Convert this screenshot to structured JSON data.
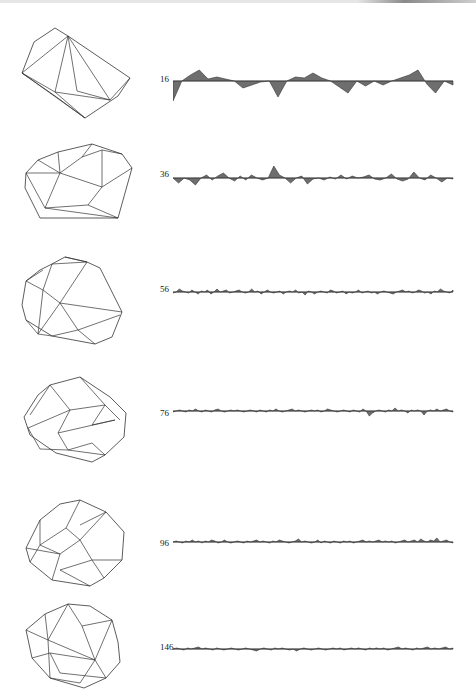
{
  "figure": {
    "fill_color": "#6e6e6e",
    "stroke_color": "#333333",
    "rows": [
      {
        "label": "16",
        "top": 8,
        "poly_points": [
          [
            22,
            65
          ],
          [
            34,
            34
          ],
          [
            55,
            20
          ],
          [
            68,
            28
          ],
          [
            130,
            70
          ],
          [
            118,
            88
          ],
          [
            85,
            110
          ],
          [
            55,
            88
          ]
        ],
        "poly_edges": [
          [
            68,
            28,
            55,
            84
          ],
          [
            68,
            28,
            77,
            83
          ],
          [
            68,
            28,
            110,
            92
          ],
          [
            68,
            28,
            22,
            65
          ],
          [
            55,
            84,
            110,
            92
          ],
          [
            77,
            83,
            110,
            92
          ],
          [
            22,
            65,
            55,
            84
          ],
          [
            55,
            84,
            85,
            110
          ],
          [
            110,
            92,
            130,
            70
          ],
          [
            22,
            65,
            85,
            110
          ]
        ],
        "sig_top": 60,
        "sig_height": 45,
        "label_y": 74,
        "baseline": 21,
        "values": [
          -20,
          0,
          6,
          11,
          2,
          4,
          2,
          0,
          -7,
          -4,
          -1,
          0,
          -16,
          0,
          4,
          3,
          8,
          3,
          0,
          -6,
          -12,
          0,
          -5,
          0,
          -4,
          0,
          3,
          6,
          11,
          -3,
          -12,
          0,
          -4
        ]
      },
      {
        "label": "36",
        "top": 130,
        "poly_points": [
          [
            26,
            43
          ],
          [
            38,
            30
          ],
          [
            58,
            22
          ],
          [
            92,
            14
          ],
          [
            122,
            24
          ],
          [
            132,
            38
          ],
          [
            118,
            88
          ],
          [
            40,
            88
          ],
          [
            25,
            58
          ]
        ],
        "poly_edges": [
          [
            58,
            22,
            60,
            43
          ],
          [
            60,
            43,
            102,
            57
          ],
          [
            60,
            43,
            26,
            43
          ],
          [
            60,
            43,
            45,
            78
          ],
          [
            92,
            14,
            82,
            27
          ],
          [
            82,
            27,
            60,
            43
          ],
          [
            102,
            57,
            102,
            20
          ],
          [
            102,
            57,
            132,
            38
          ],
          [
            102,
            57,
            88,
            75
          ],
          [
            88,
            75,
            45,
            78
          ],
          [
            88,
            75,
            118,
            88
          ],
          [
            45,
            78,
            118,
            88
          ],
          [
            26,
            43,
            45,
            78
          ],
          [
            38,
            30,
            60,
            43
          ],
          [
            102,
            20,
            82,
            27
          ],
          [
            122,
            24,
            102,
            20
          ]
        ],
        "sig_top": 150,
        "sig_height": 45,
        "label_y": 169,
        "baseline": 28,
        "values": [
          0,
          -5,
          0,
          -2,
          -7,
          0,
          3,
          -2,
          2,
          5,
          0,
          -3,
          2,
          -2,
          3,
          0,
          -2,
          0,
          12,
          3,
          0,
          -5,
          0,
          2,
          -6,
          -1,
          0,
          -2,
          1,
          -1,
          3,
          -1,
          2,
          0,
          1,
          3,
          -1,
          -2,
          0,
          4,
          -1,
          -3,
          -1,
          6,
          0,
          -2,
          3,
          0,
          -4,
          0,
          -1
        ]
      },
      {
        "label": "56",
        "top": 240,
        "poly_points": [
          [
            26,
            41
          ],
          [
            40,
            30
          ],
          [
            52,
            24
          ],
          [
            65,
            17
          ],
          [
            87,
            22
          ],
          [
            100,
            28
          ],
          [
            122,
            72
          ],
          [
            112,
            97
          ],
          [
            95,
            104
          ],
          [
            52,
            96
          ],
          [
            26,
            80
          ],
          [
            22,
            65
          ]
        ],
        "poly_edges": [
          [
            52,
            24,
            43,
            50
          ],
          [
            43,
            50,
            60,
            63
          ],
          [
            60,
            63,
            87,
            22
          ],
          [
            60,
            63,
            122,
            72
          ],
          [
            60,
            63,
            38,
            94
          ],
          [
            60,
            63,
            78,
            90
          ],
          [
            43,
            50,
            26,
            41
          ],
          [
            43,
            50,
            38,
            94
          ],
          [
            26,
            41,
            43,
            30
          ],
          [
            78,
            90,
            120,
            75
          ],
          [
            78,
            90,
            95,
            104
          ],
          [
            78,
            90,
            52,
            96
          ],
          [
            38,
            94,
            52,
            96
          ],
          [
            26,
            80,
            38,
            94
          ],
          [
            52,
            24,
            87,
            22
          ],
          [
            65,
            17,
            87,
            22
          ]
        ],
        "sig_top": 275,
        "sig_height": 35,
        "label_y": 284,
        "baseline": 17,
        "values": [
          -1,
          0,
          3,
          1,
          0,
          -1,
          2,
          0,
          -2,
          1,
          0,
          2,
          -2,
          0,
          3,
          0,
          1,
          2,
          -1,
          0,
          1,
          2,
          0,
          -1,
          0,
          3,
          0,
          1,
          -2,
          0,
          2,
          0,
          -1,
          0,
          1,
          -2,
          0,
          1,
          0,
          2,
          -1,
          0,
          -3,
          1,
          0,
          -2,
          0,
          1,
          0,
          -1,
          2,
          1,
          -1,
          0,
          1,
          -2,
          0,
          -1,
          0,
          2,
          -1,
          0,
          1,
          -1,
          0,
          -2,
          0,
          1,
          0,
          -1,
          -2,
          0,
          1,
          2,
          0,
          1,
          -1,
          0,
          2,
          1,
          -1,
          0,
          -2,
          1,
          0,
          3,
          1,
          0,
          -1,
          2
        ]
      },
      {
        "label": "76",
        "top": 365,
        "poly_points": [
          [
            24,
            52
          ],
          [
            38,
            30
          ],
          [
            50,
            20
          ],
          [
            80,
            12
          ],
          [
            110,
            32
          ],
          [
            126,
            48
          ],
          [
            124,
            72
          ],
          [
            105,
            90
          ],
          [
            92,
            97
          ],
          [
            56,
            88
          ],
          [
            30,
            70
          ]
        ],
        "poly_edges": [
          [
            50,
            20,
            70,
            45
          ],
          [
            70,
            45,
            105,
            40
          ],
          [
            70,
            45,
            28,
            63
          ],
          [
            70,
            45,
            58,
            68
          ],
          [
            58,
            68,
            68,
            85
          ],
          [
            68,
            85,
            105,
            90
          ],
          [
            58,
            68,
            115,
            55
          ],
          [
            105,
            40,
            120,
            55
          ],
          [
            28,
            63,
            40,
            84
          ],
          [
            40,
            84,
            68,
            85
          ],
          [
            80,
            12,
            105,
            40
          ],
          [
            50,
            20,
            30,
            50
          ],
          [
            92,
            78,
            105,
            90
          ],
          [
            92,
            78,
            68,
            85
          ],
          [
            105,
            40,
            92,
            60
          ],
          [
            92,
            60,
            115,
            55
          ]
        ],
        "sig_top": 397,
        "sig_height": 30,
        "label_y": 408,
        "baseline": 14,
        "values": [
          -1,
          0,
          1,
          0,
          -1,
          1,
          0,
          2,
          0,
          -1,
          1,
          0,
          -1,
          1,
          2,
          0,
          -1,
          0,
          1,
          0,
          1,
          0,
          -1,
          0,
          1,
          0,
          -1,
          1,
          0,
          -1,
          1,
          0,
          2,
          0,
          -1,
          0,
          1,
          2,
          0,
          1,
          0,
          -1,
          0,
          1,
          0,
          1,
          -1,
          0,
          2,
          1,
          0,
          -1,
          0,
          1,
          0,
          -1,
          1,
          0,
          -1,
          2,
          0,
          -5,
          -2,
          0,
          1,
          0,
          -1,
          1,
          0,
          3,
          0,
          1,
          0,
          -2,
          1,
          0,
          1,
          0,
          -4,
          0,
          1,
          0,
          2,
          0,
          1,
          2,
          0,
          -1
        ]
      },
      {
        "label": "96",
        "top": 490,
        "poly_points": [
          [
            26,
            58
          ],
          [
            40,
            30
          ],
          [
            60,
            14
          ],
          [
            80,
            10
          ],
          [
            106,
            22
          ],
          [
            124,
            42
          ],
          [
            122,
            70
          ],
          [
            104,
            88
          ],
          [
            90,
            96
          ],
          [
            52,
            90
          ],
          [
            30,
            72
          ]
        ],
        "poly_edges": [
          [
            40,
            30,
            40,
            55
          ],
          [
            40,
            55,
            66,
            38
          ],
          [
            66,
            38,
            80,
            10
          ],
          [
            66,
            38,
            80,
            50
          ],
          [
            80,
            50,
            106,
            22
          ],
          [
            80,
            50,
            60,
            64
          ],
          [
            60,
            64,
            40,
            55
          ],
          [
            60,
            64,
            52,
            90
          ],
          [
            80,
            50,
            92,
            70
          ],
          [
            92,
            70,
            122,
            70
          ],
          [
            92,
            70,
            104,
            88
          ],
          [
            92,
            70,
            60,
            80
          ],
          [
            60,
            80,
            90,
            96
          ],
          [
            30,
            72,
            40,
            55
          ],
          [
            26,
            58,
            60,
            64
          ],
          [
            106,
            22,
            80,
            35
          ]
        ],
        "sig_top": 528,
        "sig_height": 30,
        "label_y": 538,
        "baseline": 14,
        "values": [
          0,
          1,
          0,
          -1,
          1,
          0,
          2,
          0,
          1,
          -1,
          1,
          0,
          2,
          1,
          -1,
          0,
          2,
          0,
          -1,
          0,
          1,
          0,
          -1,
          1,
          0,
          1,
          2,
          0,
          1,
          0,
          -1,
          1,
          0,
          2,
          1,
          0,
          -1,
          0,
          1,
          3,
          0,
          1,
          0,
          -1,
          0,
          2,
          -1,
          1,
          0,
          -1,
          1,
          0,
          -1,
          1,
          0,
          1,
          -1,
          0,
          1,
          2,
          0,
          1,
          0,
          1,
          2,
          0,
          1,
          0,
          1,
          -1,
          0,
          1,
          2,
          0,
          1,
          2,
          0,
          3,
          1,
          0,
          2,
          1,
          4,
          0,
          1,
          2,
          0,
          -1
        ]
      },
      {
        "label": "146",
        "top": 598,
        "poly_points": [
          [
            26,
            32
          ],
          [
            45,
            16
          ],
          [
            68,
            6
          ],
          [
            90,
            8
          ],
          [
            112,
            22
          ],
          [
            118,
            44
          ],
          [
            120,
            64
          ],
          [
            106,
            80
          ],
          [
            84,
            90
          ],
          [
            50,
            80
          ],
          [
            32,
            60
          ]
        ],
        "poly_edges": [
          [
            45,
            16,
            48,
            42
          ],
          [
            48,
            42,
            68,
            6
          ],
          [
            48,
            42,
            95,
            62
          ],
          [
            95,
            62,
            112,
            22
          ],
          [
            95,
            62,
            80,
            85
          ],
          [
            80,
            85,
            50,
            80
          ],
          [
            50,
            80,
            48,
            42
          ],
          [
            26,
            32,
            48,
            42
          ],
          [
            32,
            60,
            50,
            55
          ],
          [
            50,
            55,
            95,
            62
          ],
          [
            68,
            6,
            82,
            28
          ],
          [
            82,
            28,
            112,
            22
          ],
          [
            82,
            28,
            95,
            62
          ],
          [
            50,
            55,
            60,
            75
          ],
          [
            60,
            75,
            106,
            80
          ],
          [
            106,
            80,
            95,
            62
          ]
        ],
        "sig_top": 636,
        "sig_height": 30,
        "label_y": 642,
        "baseline": 13,
        "values": [
          0,
          1,
          0,
          -1,
          1,
          0,
          1,
          2,
          0,
          1,
          0,
          -1,
          1,
          0,
          -1,
          0,
          1,
          0,
          -1,
          0,
          1,
          0,
          -1,
          -2,
          0,
          1,
          0,
          -1,
          1,
          0,
          1,
          0,
          -1,
          0,
          -2,
          0,
          1,
          0,
          -1,
          0,
          1,
          0,
          -1,
          0,
          1,
          0,
          1,
          -1,
          0,
          1,
          0,
          1,
          0,
          -1,
          1,
          0,
          1,
          0,
          1,
          -1,
          0,
          1,
          2,
          0,
          1,
          0,
          -1,
          1,
          0,
          1,
          2,
          0,
          1,
          0,
          1,
          2,
          0,
          1
        ]
      }
    ]
  }
}
